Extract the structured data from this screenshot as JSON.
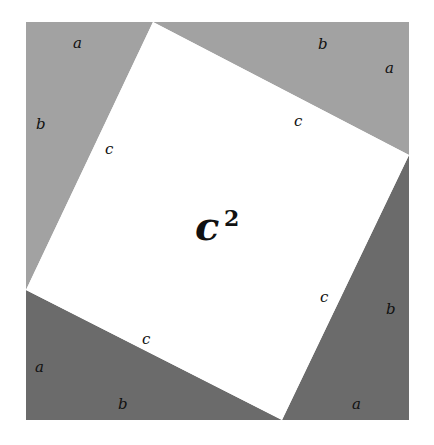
{
  "diagram": {
    "colors": {
      "light_triangle": "#a2a2a2",
      "dark_triangle": "#6b6b6b",
      "inner_square": "#ffffff"
    },
    "center_label": {
      "base": "c",
      "exponent": "2"
    },
    "triangles": [
      {
        "id": "top-left",
        "shade": "light",
        "labels": {
          "a": "a",
          "b": "b",
          "c": "c"
        }
      },
      {
        "id": "top-right",
        "shade": "light",
        "labels": {
          "a": "a",
          "b": "b",
          "c": "c"
        }
      },
      {
        "id": "bottom-left",
        "shade": "dark",
        "labels": {
          "a": "a",
          "b": "b",
          "c": "c"
        }
      },
      {
        "id": "bottom-right",
        "shade": "dark",
        "labels": {
          "a": "a",
          "b": "b",
          "c": "c"
        }
      }
    ]
  }
}
